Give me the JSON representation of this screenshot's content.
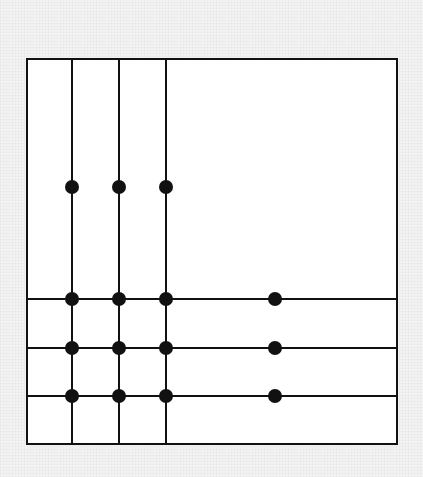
{
  "diagram": {
    "frame": {
      "x": 27,
      "y": 59,
      "width": 370,
      "height": 385,
      "fill": "#ffffff",
      "stroke": "#111111"
    },
    "vertical_lines": [
      {
        "x": 72,
        "y1": 59,
        "y2": 444
      },
      {
        "x": 119,
        "y1": 59,
        "y2": 444
      },
      {
        "x": 166,
        "y1": 59,
        "y2": 444
      }
    ],
    "horizontal_lines": [
      {
        "y": 299,
        "x1": 27,
        "x2": 397
      },
      {
        "y": 348,
        "x1": 27,
        "x2": 397
      },
      {
        "y": 396,
        "x1": 27,
        "x2": 397
      }
    ],
    "dots": [
      {
        "x": 72,
        "y": 187
      },
      {
        "x": 119,
        "y": 187
      },
      {
        "x": 166,
        "y": 187
      },
      {
        "x": 72,
        "y": 299
      },
      {
        "x": 119,
        "y": 299
      },
      {
        "x": 166,
        "y": 299
      },
      {
        "x": 275,
        "y": 299
      },
      {
        "x": 72,
        "y": 348
      },
      {
        "x": 119,
        "y": 348
      },
      {
        "x": 166,
        "y": 348
      },
      {
        "x": 275,
        "y": 348
      },
      {
        "x": 72,
        "y": 396
      },
      {
        "x": 119,
        "y": 396
      },
      {
        "x": 166,
        "y": 396
      },
      {
        "x": 275,
        "y": 396
      }
    ],
    "dot_radius": 7,
    "line_color": "#111111",
    "line_width": 2
  }
}
